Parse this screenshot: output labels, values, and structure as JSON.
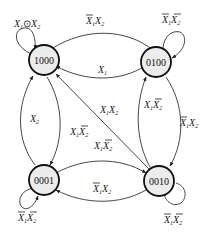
{
  "diagram": {
    "type": "state-transition",
    "states": [
      {
        "id": "1000",
        "label": "1000"
      },
      {
        "id": "0100",
        "label": "0100"
      },
      {
        "id": "0001",
        "label": "0001"
      },
      {
        "id": "0010",
        "label": "0010"
      }
    ],
    "transitions": [
      {
        "from": "1000",
        "to": "1000",
        "condition": "X1⊙X2",
        "label_parts": {
          "a": "X",
          "a_sub": "1",
          "op": "⊙",
          "b": "X",
          "b_sub": "2"
        }
      },
      {
        "from": "1000",
        "to": "0100",
        "condition": "X̄1X2",
        "label_parts": {
          "a": "X",
          "a_sub": "1",
          "b": "X",
          "b_sub": "2"
        }
      },
      {
        "from": "0100",
        "to": "1000",
        "condition": "X1",
        "label_parts": {
          "a": "X",
          "a_sub": "1"
        }
      },
      {
        "from": "0100",
        "to": "0100",
        "condition": "X̄1X̄2",
        "label_parts": {
          "a": "X",
          "a_sub": "1",
          "b": "X",
          "b_sub": "2"
        }
      },
      {
        "from": "0010",
        "to": "1000",
        "condition": "X1X2",
        "label_parts": {
          "a": "X",
          "a_sub": "1",
          "b": "X",
          "b_sub": "2"
        }
      },
      {
        "from": "0010",
        "to": "0100",
        "condition": "X1X̄2",
        "label_parts": {
          "a": "X",
          "a_sub": "1",
          "b": "X",
          "b_sub": "2"
        }
      },
      {
        "from": "0100",
        "to": "0010",
        "condition": "X̄1X2",
        "label_parts": {
          "a": "X",
          "a_sub": "1",
          "b": "X",
          "b_sub": "2"
        }
      },
      {
        "from": "0001",
        "to": "1000",
        "condition": "X2",
        "label_parts": {
          "a": "X",
          "a_sub": "2"
        }
      },
      {
        "from": "1000",
        "to": "0001",
        "condition": "X1X̄2",
        "label_parts": {
          "a": "X",
          "a_sub": "1",
          "b": "X",
          "b_sub": "2"
        }
      },
      {
        "from": "0001",
        "to": "0010",
        "condition": "X1X̄2",
        "label_parts": {
          "a": "X",
          "a_sub": "1",
          "b": "X",
          "b_sub": "2"
        }
      },
      {
        "from": "0010",
        "to": "0001",
        "condition": "X̄1X2",
        "label_parts": {
          "a": "X",
          "a_sub": "1",
          "b": "X",
          "b_sub": "2"
        }
      },
      {
        "from": "0001",
        "to": "0001",
        "condition": "X̄1X̄2",
        "label_parts": {
          "a": "X",
          "a_sub": "1",
          "b": "X",
          "b_sub": "2"
        }
      },
      {
        "from": "0010",
        "to": "0010",
        "condition": "X̄1X̄2",
        "label_parts": {
          "a": "X",
          "a_sub": "1",
          "b": "X",
          "b_sub": "2"
        }
      }
    ]
  }
}
